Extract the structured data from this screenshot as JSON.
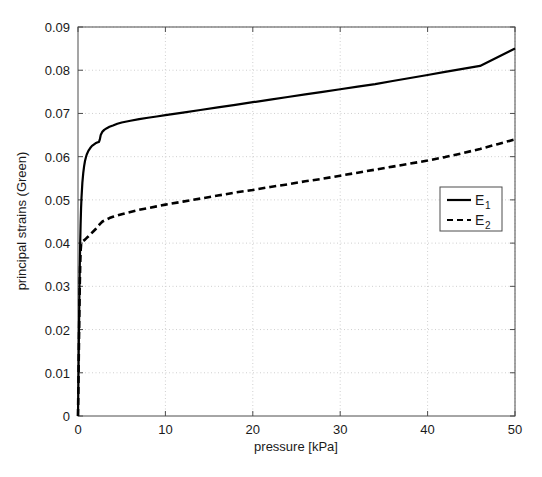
{
  "chart_data": {
    "type": "line",
    "title": "",
    "xlabel": "pressure [kPa]",
    "ylabel": "principal strains (Green)",
    "xlim": [
      0,
      50
    ],
    "ylim": [
      0,
      0.09
    ],
    "xticks": [
      "0",
      "10",
      "20",
      "30",
      "40",
      "50"
    ],
    "xtick_values": [
      0,
      10,
      20,
      30,
      40,
      50
    ],
    "yticks": [
      "0",
      "0.01",
      "0.02",
      "0.03",
      "0.04",
      "0.05",
      "0.06",
      "0.07",
      "0.08",
      "0.09"
    ],
    "ytick_values": [
      0,
      0.01,
      0.02,
      0.03,
      0.04,
      0.05,
      0.06,
      0.07,
      0.08,
      0.09
    ],
    "grid": true,
    "grid_style": "dotted",
    "grid_color": "#cfcfcf",
    "legend_position": "center-right",
    "line_color": "#000000",
    "series": [
      {
        "name": "E_1",
        "label": "E",
        "subscript": "1",
        "style": "solid",
        "x": [
          0,
          0.05,
          0.1,
          0.15,
          0.2,
          0.25,
          0.3,
          0.35,
          0.4,
          0.5,
          0.6,
          0.7,
          0.8,
          0.9,
          1.0,
          1.2,
          1.4,
          1.6,
          1.8,
          2.0,
          2.2,
          2.4,
          2.5,
          2.6,
          2.8,
          3.0,
          3.3,
          3.6,
          4.0,
          4.5,
          5.0,
          6.0,
          7.0,
          8.0,
          9.0,
          10.0,
          12.0,
          14.0,
          16.0,
          18.0,
          20.0,
          22.0,
          24.0,
          26.0,
          28.0,
          30.0,
          32.0,
          34.0,
          36.0,
          38.0,
          40.0,
          42.0,
          44.0,
          46.0,
          48.0,
          50.0
        ],
        "y": [
          0,
          0.0085,
          0.0175,
          0.0265,
          0.034,
          0.04,
          0.0445,
          0.048,
          0.0505,
          0.054,
          0.0562,
          0.0578,
          0.059,
          0.0598,
          0.0605,
          0.0614,
          0.062,
          0.0625,
          0.0628,
          0.0631,
          0.0633,
          0.0634,
          0.064,
          0.065,
          0.0658,
          0.0662,
          0.0666,
          0.0669,
          0.0672,
          0.0676,
          0.0679,
          0.0683,
          0.0687,
          0.069,
          0.0693,
          0.0696,
          0.0702,
          0.0708,
          0.0714,
          0.072,
          0.0726,
          0.0732,
          0.0738,
          0.0744,
          0.075,
          0.0756,
          0.0762,
          0.0768,
          0.0775,
          0.0782,
          0.0789,
          0.0796,
          0.0803,
          0.081,
          0.083,
          0.085
        ]
      },
      {
        "name": "E_2",
        "label": "E",
        "subscript": "2",
        "style": "dashed",
        "x": [
          0,
          0.05,
          0.1,
          0.15,
          0.2,
          0.25,
          0.3,
          0.35,
          0.4,
          0.5,
          0.6,
          0.8,
          1.0,
          1.2,
          1.5,
          1.8,
          2.0,
          2.2,
          2.5,
          2.8,
          3.0,
          3.3,
          3.6,
          4.0,
          4.5,
          5.0,
          6.0,
          7.0,
          8.0,
          9.0,
          10.0,
          12.0,
          14.0,
          16.0,
          18.0,
          20.0,
          22.0,
          24.0,
          26.0,
          28.0,
          30.0,
          32.0,
          34.0,
          36.0,
          38.0,
          40.0,
          42.0,
          44.0,
          46.0,
          48.0,
          50.0
        ],
        "y": [
          0,
          0.0075,
          0.0155,
          0.0235,
          0.03,
          0.035,
          0.0382,
          0.0396,
          0.0401,
          0.0403,
          0.0405,
          0.0408,
          0.0412,
          0.0416,
          0.0422,
          0.0428,
          0.0432,
          0.0436,
          0.0444,
          0.045,
          0.0452,
          0.0455,
          0.0458,
          0.0461,
          0.0464,
          0.0467,
          0.0472,
          0.0477,
          0.0481,
          0.0485,
          0.0489,
          0.0496,
          0.0503,
          0.051,
          0.0517,
          0.0523,
          0.053,
          0.0536,
          0.0543,
          0.0549,
          0.0556,
          0.0563,
          0.057,
          0.0577,
          0.0584,
          0.0591,
          0.0599,
          0.0608,
          0.0618,
          0.0629,
          0.064
        ]
      }
    ]
  },
  "axes": {
    "xlabel": "pressure [kPa]",
    "ylabel": "principal strains (Green)"
  },
  "legend": {
    "entries": [
      {
        "label": "E",
        "subscript": "1",
        "style": "solid"
      },
      {
        "label": "E",
        "subscript": "2",
        "style": "dashed"
      }
    ]
  }
}
